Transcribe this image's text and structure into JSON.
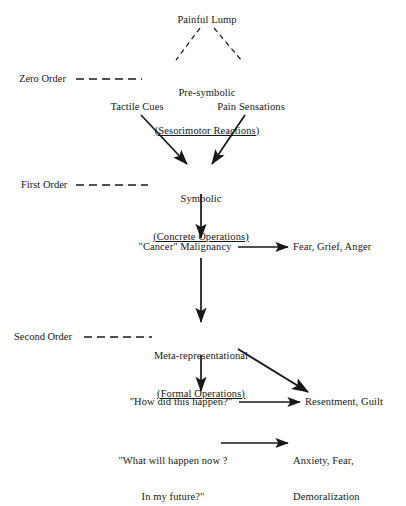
{
  "diagram": {
    "background_color": "#ffffff",
    "ink_color": "#181818",
    "nodes": {
      "painful_lump": "Painful Lump",
      "presymbolic_line1": "Pre-symbolic",
      "presymbolic_line2": "(Sesorimotor Reactions)",
      "tactile_cues": "Tactile Cues",
      "pain_sensations": "Pain Sensations",
      "symbolic_line1": "Symbolic",
      "symbolic_line2": "(Concrete Operations)",
      "cancer_malignancy": "\"Cancer\" Malignancy",
      "fear_grief_anger": "Fear, Grief, Anger",
      "meta_line1": "Meta-representational",
      "meta_line2": "(Formal Operations)",
      "how_did_this_happen": "\"How did this happen?\"",
      "resentment_guilt": "Resentment, Guilt",
      "what_will_happen_line1": "\"What will happen now ?",
      "what_will_happen_line2": "In my future?\"",
      "anxiety_line1": "Anxiety, Fear,",
      "anxiety_line2": "Demoralization"
    },
    "order_labels": {
      "zero_order": "Zero Order",
      "first_order": "First Order",
      "second_order": "Second Order"
    },
    "connectors": [
      {
        "name": "painful-lump-to-presymbolic-left",
        "style": "dashed",
        "arrow": false
      },
      {
        "name": "painful-lump-to-presymbolic-right",
        "style": "dashed",
        "arrow": false
      },
      {
        "name": "zero-order-divider",
        "style": "dashed",
        "arrow": false
      },
      {
        "name": "first-order-divider",
        "style": "dashed",
        "arrow": false
      },
      {
        "name": "second-order-divider",
        "style": "dashed",
        "arrow": false
      },
      {
        "name": "tactile-cues-to-symbolic",
        "style": "solid",
        "arrow": true
      },
      {
        "name": "pain-sensations-to-symbolic",
        "style": "solid",
        "arrow": true
      },
      {
        "name": "symbolic-to-cancer",
        "style": "solid",
        "arrow": true
      },
      {
        "name": "cancer-to-fear-grief-anger",
        "style": "solid",
        "arrow": true
      },
      {
        "name": "cancer-to-meta",
        "style": "solid",
        "arrow": true
      },
      {
        "name": "meta-to-how-did-this-happen",
        "style": "solid",
        "arrow": true
      },
      {
        "name": "meta-to-resentment-guilt",
        "style": "solid",
        "arrow": true
      },
      {
        "name": "how-did-this-happen-to-resentment-guilt",
        "style": "solid",
        "arrow": true
      },
      {
        "name": "what-will-happen-to-anxiety",
        "style": "solid",
        "arrow": true
      }
    ]
  }
}
